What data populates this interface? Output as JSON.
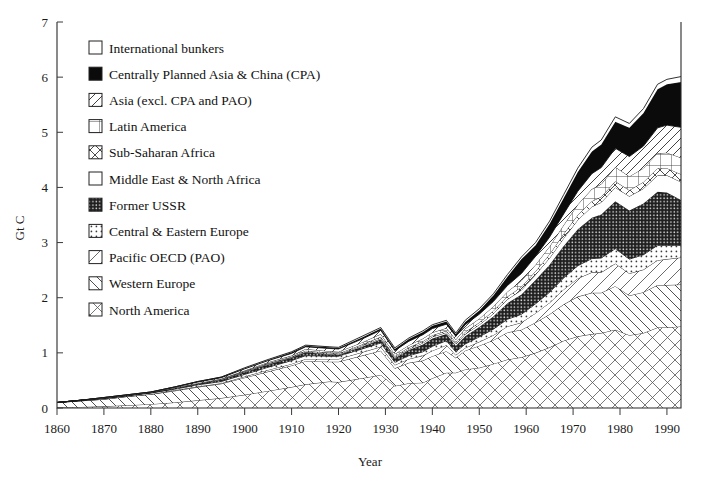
{
  "chart_data": {
    "type": "area",
    "stacked": true,
    "title": "",
    "xlabel": "Year",
    "ylabel": "Gt C",
    "xlim": [
      1860,
      1993
    ],
    "ylim": [
      0,
      7
    ],
    "xticks": [
      1860,
      1870,
      1880,
      1890,
      1900,
      1910,
      1920,
      1930,
      1940,
      1950,
      1960,
      1970,
      1980,
      1990
    ],
    "yticks": [
      0,
      1,
      2,
      3,
      4,
      5,
      6,
      7
    ],
    "grid": false,
    "legend_position": "top-left",
    "x": [
      1860,
      1865,
      1870,
      1875,
      1880,
      1885,
      1890,
      1895,
      1900,
      1905,
      1910,
      1913,
      1918,
      1920,
      1925,
      1929,
      1932,
      1935,
      1938,
      1940,
      1943,
      1945,
      1947,
      1950,
      1953,
      1956,
      1959,
      1962,
      1965,
      1968,
      1971,
      1974,
      1976,
      1979,
      1982,
      1985,
      1988,
      1990,
      1993
    ],
    "series": [
      {
        "name": "North America",
        "pattern": "crosshatch-light",
        "values": [
          0.01,
          0.02,
          0.03,
          0.05,
          0.07,
          0.1,
          0.14,
          0.18,
          0.24,
          0.31,
          0.38,
          0.43,
          0.48,
          0.47,
          0.54,
          0.6,
          0.4,
          0.45,
          0.46,
          0.54,
          0.64,
          0.64,
          0.7,
          0.73,
          0.8,
          0.88,
          0.92,
          1.0,
          1.1,
          1.22,
          1.3,
          1.34,
          1.36,
          1.42,
          1.32,
          1.36,
          1.46,
          1.46,
          1.48
        ]
      },
      {
        "name": "Western Europe",
        "pattern": "diag-back",
        "values": [
          0.09,
          0.11,
          0.13,
          0.16,
          0.18,
          0.21,
          0.24,
          0.26,
          0.31,
          0.35,
          0.39,
          0.42,
          0.36,
          0.37,
          0.41,
          0.44,
          0.32,
          0.37,
          0.4,
          0.4,
          0.39,
          0.27,
          0.34,
          0.4,
          0.43,
          0.49,
          0.5,
          0.55,
          0.6,
          0.66,
          0.72,
          0.75,
          0.73,
          0.79,
          0.72,
          0.74,
          0.77,
          0.77,
          0.76
        ]
      },
      {
        "name": "Pacific OECD (PAO)",
        "pattern": "diag-fwd-thin",
        "values": [
          0.0,
          0.0,
          0.0,
          0.0,
          0.0,
          0.01,
          0.01,
          0.01,
          0.02,
          0.03,
          0.03,
          0.04,
          0.05,
          0.05,
          0.06,
          0.07,
          0.06,
          0.07,
          0.09,
          0.1,
          0.11,
          0.05,
          0.05,
          0.07,
          0.09,
          0.11,
          0.13,
          0.17,
          0.21,
          0.27,
          0.33,
          0.37,
          0.37,
          0.41,
          0.4,
          0.41,
          0.45,
          0.47,
          0.49
        ]
      },
      {
        "name": "Central & Eastern Europe",
        "pattern": "dots-light",
        "values": [
          0.0,
          0.01,
          0.01,
          0.01,
          0.02,
          0.02,
          0.03,
          0.03,
          0.04,
          0.05,
          0.06,
          0.06,
          0.05,
          0.05,
          0.06,
          0.07,
          0.05,
          0.06,
          0.07,
          0.08,
          0.08,
          0.06,
          0.07,
          0.09,
          0.11,
          0.13,
          0.15,
          0.17,
          0.19,
          0.21,
          0.23,
          0.25,
          0.26,
          0.27,
          0.26,
          0.27,
          0.27,
          0.25,
          0.22
        ]
      },
      {
        "name": "Former USSR",
        "pattern": "dots-dark",
        "values": [
          0.0,
          0.0,
          0.01,
          0.01,
          0.01,
          0.02,
          0.02,
          0.03,
          0.04,
          0.05,
          0.05,
          0.06,
          0.03,
          0.02,
          0.04,
          0.06,
          0.07,
          0.1,
          0.13,
          0.14,
          0.12,
          0.11,
          0.14,
          0.18,
          0.23,
          0.29,
          0.36,
          0.43,
          0.5,
          0.58,
          0.66,
          0.74,
          0.79,
          0.86,
          0.88,
          0.93,
          0.97,
          0.96,
          0.82
        ]
      },
      {
        "name": "Middle East & North Africa",
        "pattern": "blank",
        "values": [
          0.0,
          0.0,
          0.0,
          0.0,
          0.0,
          0.0,
          0.0,
          0.0,
          0.01,
          0.01,
          0.01,
          0.01,
          0.01,
          0.01,
          0.02,
          0.02,
          0.02,
          0.02,
          0.03,
          0.03,
          0.03,
          0.03,
          0.04,
          0.04,
          0.05,
          0.07,
          0.08,
          0.1,
          0.12,
          0.14,
          0.17,
          0.2,
          0.22,
          0.25,
          0.26,
          0.27,
          0.3,
          0.31,
          0.33
        ]
      },
      {
        "name": "Sub-Saharan Africa",
        "pattern": "crosshatch-mid",
        "values": [
          0.0,
          0.0,
          0.0,
          0.0,
          0.0,
          0.0,
          0.0,
          0.01,
          0.01,
          0.01,
          0.01,
          0.02,
          0.02,
          0.02,
          0.02,
          0.03,
          0.02,
          0.03,
          0.03,
          0.03,
          0.03,
          0.03,
          0.04,
          0.04,
          0.05,
          0.05,
          0.06,
          0.06,
          0.07,
          0.08,
          0.09,
          0.1,
          0.1,
          0.11,
          0.11,
          0.12,
          0.13,
          0.13,
          0.14
        ]
      },
      {
        "name": "Latin America",
        "pattern": "grid",
        "values": [
          0.0,
          0.0,
          0.0,
          0.0,
          0.0,
          0.01,
          0.01,
          0.01,
          0.01,
          0.02,
          0.02,
          0.03,
          0.03,
          0.03,
          0.04,
          0.05,
          0.04,
          0.04,
          0.05,
          0.05,
          0.05,
          0.05,
          0.06,
          0.07,
          0.08,
          0.09,
          0.11,
          0.12,
          0.14,
          0.16,
          0.19,
          0.22,
          0.23,
          0.26,
          0.25,
          0.25,
          0.27,
          0.28,
          0.3
        ]
      },
      {
        "name": "Asia (excl. CPA and PAO)",
        "pattern": "diag-fwd",
        "values": [
          0.0,
          0.0,
          0.01,
          0.01,
          0.01,
          0.01,
          0.02,
          0.02,
          0.03,
          0.03,
          0.04,
          0.04,
          0.05,
          0.05,
          0.06,
          0.07,
          0.06,
          0.07,
          0.07,
          0.07,
          0.07,
          0.06,
          0.07,
          0.08,
          0.09,
          0.11,
          0.13,
          0.15,
          0.17,
          0.2,
          0.24,
          0.28,
          0.3,
          0.34,
          0.36,
          0.4,
          0.46,
          0.5,
          0.55
        ]
      },
      {
        "name": "Centrally Planned Asia & China (CPA)",
        "pattern": "solid-black",
        "values": [
          0.0,
          0.0,
          0.0,
          0.0,
          0.0,
          0.0,
          0.01,
          0.01,
          0.01,
          0.01,
          0.02,
          0.02,
          0.02,
          0.02,
          0.03,
          0.03,
          0.03,
          0.04,
          0.05,
          0.05,
          0.05,
          0.04,
          0.05,
          0.07,
          0.11,
          0.16,
          0.26,
          0.2,
          0.24,
          0.29,
          0.35,
          0.4,
          0.42,
          0.48,
          0.52,
          0.6,
          0.7,
          0.74,
          0.82
        ]
      },
      {
        "name": "International bunkers",
        "pattern": "blank",
        "values": [
          0.0,
          0.0,
          0.0,
          0.0,
          0.0,
          0.0,
          0.0,
          0.0,
          0.01,
          0.01,
          0.01,
          0.01,
          0.01,
          0.01,
          0.02,
          0.02,
          0.02,
          0.02,
          0.02,
          0.02,
          0.02,
          0.02,
          0.03,
          0.03,
          0.03,
          0.04,
          0.04,
          0.05,
          0.05,
          0.06,
          0.07,
          0.08,
          0.08,
          0.09,
          0.08,
          0.08,
          0.09,
          0.09,
          0.1
        ]
      }
    ],
    "legend_entries": [
      {
        "label": "International bunkers",
        "pattern": "blank"
      },
      {
        "label": "Centrally Planned Asia & China (CPA)",
        "pattern": "solid-black"
      },
      {
        "label": "Asia (excl. CPA and PAO)",
        "pattern": "diag-fwd"
      },
      {
        "label": "Latin America",
        "pattern": "grid"
      },
      {
        "label": "Sub-Saharan Africa",
        "pattern": "crosshatch-mid"
      },
      {
        "label": "Middle East & North Africa",
        "pattern": "blank"
      },
      {
        "label": "Former USSR",
        "pattern": "dots-dark"
      },
      {
        "label": "Central & Eastern Europe",
        "pattern": "dots-light"
      },
      {
        "label": "Pacific OECD (PAO)",
        "pattern": "diag-fwd-thin"
      },
      {
        "label": "Western Europe",
        "pattern": "diag-back"
      },
      {
        "label": "North America",
        "pattern": "crosshatch-light"
      }
    ],
    "colors": {
      "axis": "#2b2b2b",
      "text": "#1a1a1a",
      "black_series": "#0b0b0b",
      "background": "#ffffff"
    }
  }
}
